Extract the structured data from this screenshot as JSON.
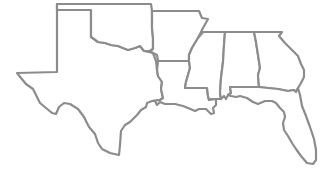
{
  "map": {
    "region": "Southern United States",
    "line_color": "#8c8c8c",
    "fill_color": "#ffffff",
    "background": "#ffffff",
    "states": [
      {
        "id": "TX",
        "name": "Texas"
      },
      {
        "id": "OK",
        "name": "Oklahoma"
      },
      {
        "id": "AR",
        "name": "Arkansas"
      },
      {
        "id": "LA",
        "name": "Louisiana"
      },
      {
        "id": "MS",
        "name": "Mississippi"
      },
      {
        "id": "AL",
        "name": "Alabama"
      },
      {
        "id": "GA",
        "name": "Georgia"
      },
      {
        "id": "FL",
        "name": "Florida"
      }
    ]
  }
}
